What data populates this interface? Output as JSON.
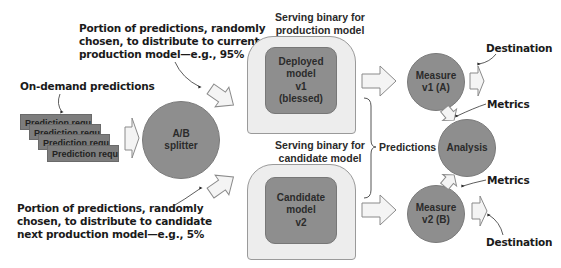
{
  "annotations": {
    "top_note": [
      "Portion of predictions, randomly",
      "chosen, to distribute to current",
      "production model—e.g., 95%"
    ],
    "bottom_note": [
      "Portion of predictions, randomly",
      "chosen, to distribute to candidate",
      "next production model—e.g., 5%"
    ],
    "on_demand": "On-demand predictions",
    "predictions": "Predictions",
    "destination_top": "Destination",
    "destination_bottom": "Destination",
    "metrics_top": "Metrics",
    "metrics_bottom": "Metrics"
  },
  "requests": {
    "items": [
      "Prediction request",
      "Prediction request",
      "Prediction request",
      "Prediction request"
    ]
  },
  "splitter": {
    "line1": "A/B",
    "line2": "splitter"
  },
  "production": {
    "title_line1": "Serving binary for",
    "title_line2": "production model",
    "model_lines": [
      "Deployed",
      "model",
      "v1",
      "(blessed)"
    ]
  },
  "candidate": {
    "title_line1": "Serving binary for",
    "title_line2": "candidate model",
    "model_lines": [
      "Candidate",
      "model",
      "v2"
    ]
  },
  "measure_a": {
    "line1": "Measure",
    "line2": "v1 (A)"
  },
  "measure_b": {
    "line1": "Measure",
    "line2": "v2 (B)"
  },
  "analysis": {
    "label": "Analysis"
  },
  "colors": {
    "node_fill": "#8e8e8e",
    "box_fill": "#ededed",
    "arrow_fill": "#f4f4f4",
    "text": "#1a1a1a"
  }
}
